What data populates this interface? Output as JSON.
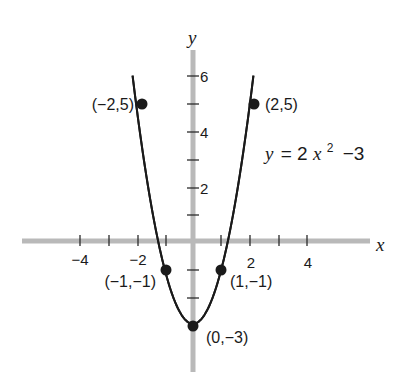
{
  "chart_data": {
    "type": "line",
    "title": "",
    "equation": "y = 2x^2 - 3",
    "xlabel": "x",
    "ylabel": "y",
    "xlim": [
      -5.9,
      6.2
    ],
    "ylim": [
      -4.6,
      6.8
    ],
    "x_ticks": [
      -4,
      -3,
      -2,
      -1,
      1,
      2,
      3,
      4
    ],
    "x_tick_labels": [
      "-4",
      "-2",
      "2",
      "4"
    ],
    "x_tick_labels_display": [
      "−4",
      "−2",
      "2",
      "4"
    ],
    "y_ticks": [
      -2,
      -1,
      1,
      2,
      3,
      4,
      5,
      6
    ],
    "y_tick_labels": [
      "2",
      "4",
      "6"
    ],
    "grid": false,
    "series": [
      {
        "name": "y = 2x^2 - 3",
        "x_range": [
          -2.12,
          2.12
        ],
        "points": [
          {
            "x": -2,
            "y": 5,
            "label": "(−2,5)"
          },
          {
            "x": -1,
            "y": -1,
            "label": "(−1,−1)"
          },
          {
            "x": 0,
            "y": -3,
            "label": "(0,−3)"
          },
          {
            "x": 1,
            "y": -1,
            "label": "(1,−1)"
          },
          {
            "x": 2,
            "y": 5,
            "label": "(2,5)"
          }
        ]
      }
    ],
    "annotations": [
      {
        "text": "y = 2x² − 3",
        "position": "right of curve, near y=3.5"
      }
    ]
  },
  "labels": {
    "x_axis": "x",
    "y_axis": "y",
    "x_tick_neg4": "−4",
    "x_tick_neg2": "−2",
    "x_tick_2": "2",
    "x_tick_4": "4",
    "y_tick_2": "2",
    "y_tick_4": "4",
    "y_tick_6": "6",
    "pt_neg2_5": "(−2,5)",
    "pt_2_5": "(2,5)",
    "pt_neg1_neg1": "(−1,−1)",
    "pt_1_neg1": "(1,−1)",
    "pt_0_neg3": "(0,−3)",
    "eq_y": "y",
    "eq_equals": "= 2",
    "eq_x": "x",
    "eq_exp": "2",
    "eq_rest": "−3"
  },
  "colors": {
    "axis": "#b9b9b9",
    "curve": "#1a1a1a",
    "points": "#1a1a1a",
    "background": "#ffffff"
  }
}
